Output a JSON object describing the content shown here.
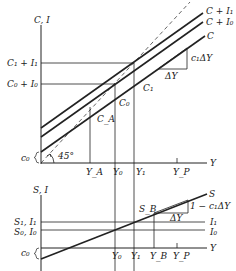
{
  "top_panel": {
    "y_axis_label": "C, I",
    "x_axis_label": "Y",
    "left_labels": {
      "c1_i1": "C₁ + I₁",
      "c0_i0": "C₀ + I₀",
      "c0": "c₀"
    },
    "line_labels": {
      "c_i1": "C + I₁",
      "c_i0": "C + I₀",
      "c": "C"
    },
    "point_labels": {
      "ca": "C_A",
      "c0": "C₀",
      "c1": "C₁"
    },
    "triangle": {
      "vertical": "c₁ΔY",
      "horizontal": "ΔY"
    },
    "angle_label": "45°",
    "x_ticks": [
      "Y_A",
      "Y₀",
      "Y₁",
      "Y_P"
    ]
  },
  "bottom_panel": {
    "y_axis_label": "S, I",
    "x_axis_label": "Y",
    "left_labels": {
      "s1_i1": "S₁, I₁",
      "s0_i0": "S₀, I₀",
      "c0": "c₀"
    },
    "line_labels": {
      "s": "S",
      "i1": "I₁",
      "i0": "I₀"
    },
    "point_labels": {
      "sb": "S_B"
    },
    "triangle": {
      "vertical": "1 − c₁ΔY",
      "horizontal": "ΔY"
    },
    "x_ticks": [
      "Y₀",
      "Y₁",
      "Y_B",
      "Y_P"
    ]
  }
}
